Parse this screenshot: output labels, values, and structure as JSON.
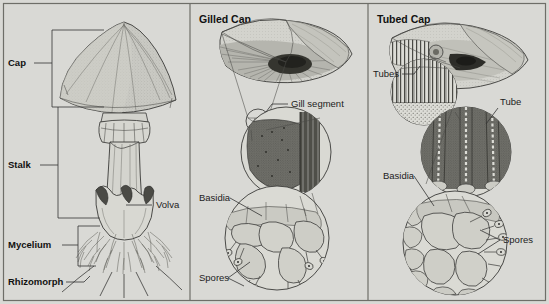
{
  "figure": {
    "background_color": "#d9d9d5",
    "border_color": "#6e6e68",
    "ink_color": "#333333",
    "width": 549,
    "height": 304
  },
  "panels": [
    {
      "id": "whole-mushroom",
      "header": "",
      "labels": [
        {
          "key": "cap",
          "text": "Cap",
          "bold": true,
          "x": 8,
          "y": 66
        },
        {
          "key": "stalk",
          "text": "Stalk",
          "bold": true,
          "x": 8,
          "y": 168
        },
        {
          "key": "volva",
          "text": "Volva",
          "bold": false,
          "x": 156,
          "y": 208
        },
        {
          "key": "mycelium",
          "text": "Mycelium",
          "bold": true,
          "x": 8,
          "y": 248
        },
        {
          "key": "rhizomorph",
          "text": "Rhizomorph",
          "bold": true,
          "x": 8,
          "y": 285
        }
      ]
    },
    {
      "id": "gilled-cap",
      "header": "Gilled Cap",
      "header_x": 199,
      "header_y": 23,
      "labels": [
        {
          "key": "gill-segment",
          "text": "Gill segment",
          "bold": false,
          "x": 291,
          "y": 107
        },
        {
          "key": "basidia",
          "text": "Basidia",
          "bold": false,
          "x": 199,
          "y": 201
        },
        {
          "key": "spores",
          "text": "Spores",
          "bold": false,
          "x": 199,
          "y": 281
        }
      ]
    },
    {
      "id": "tubed-cap",
      "header": "Tubed Cap",
      "header_x": 377,
      "header_y": 23,
      "labels": [
        {
          "key": "tubes",
          "text": "Tubes",
          "bold": false,
          "x": 373,
          "y": 77
        },
        {
          "key": "tube",
          "text": "Tube",
          "bold": false,
          "x": 500,
          "y": 105
        },
        {
          "key": "basidia",
          "text": "Basidia",
          "bold": false,
          "x": 383,
          "y": 179
        },
        {
          "key": "spores",
          "text": "Spores",
          "bold": false,
          "x": 503,
          "y": 243
        }
      ]
    }
  ],
  "structures": {
    "whole_mushroom_parts": [
      "cap",
      "stalk",
      "volva",
      "mycelium",
      "rhizomorph"
    ],
    "gilled_detail_levels": [
      "cap cutaway",
      "gill segment",
      "gill surface magnified",
      "basidia with spores"
    ],
    "tubed_detail_levels": [
      "cap cutaway",
      "tubes",
      "tube wall magnified",
      "basidia with spores"
    ]
  }
}
